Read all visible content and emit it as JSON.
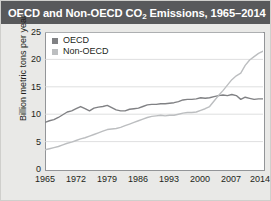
{
  "figure": {
    "title_main": "OECD and Non-OECD CO",
    "title_sub": "2",
    "title_rest": " Emissions, 1965–2014",
    "title_full": "OECD and Non-OECD CO2 Emissions, 1965–2014",
    "title_bar_color": "#58595b",
    "background_color": "#e9e9e7",
    "plot_background": "#ffffff",
    "frame_color": "#939598"
  },
  "legend": {
    "position": "top-left-inside",
    "entries": [
      {
        "label": "OECD",
        "color": "#808184"
      },
      {
        "label": "Non-OECD",
        "color": "#bcbec0"
      }
    ]
  },
  "axes": {
    "ylabel": "Billion metric tons per year",
    "yticks": [
      "0",
      "5",
      "10",
      "15",
      "20",
      "25"
    ],
    "xticks": [
      "1965",
      "1972",
      "1979",
      "1986",
      "1993",
      "2000",
      "2007",
      "2014"
    ]
  },
  "chart_data": {
    "type": "line",
    "title": "OECD and Non-OECD CO2 Emissions, 1965–2014",
    "xlabel": "",
    "ylabel": "Billion metric tons per year",
    "xlim": [
      1965,
      2014
    ],
    "ylim": [
      0,
      25
    ],
    "ytick_values": [
      0,
      5,
      10,
      15,
      20,
      25
    ],
    "xtick_values": [
      1965,
      1972,
      1979,
      1986,
      1993,
      2000,
      2007,
      2014
    ],
    "grid": "horizontal",
    "legend_position": "upper left",
    "x": [
      1965,
      1966,
      1967,
      1968,
      1969,
      1970,
      1971,
      1972,
      1973,
      1974,
      1975,
      1976,
      1977,
      1978,
      1979,
      1980,
      1981,
      1982,
      1983,
      1984,
      1985,
      1986,
      1987,
      1988,
      1989,
      1990,
      1991,
      1992,
      1993,
      1994,
      1995,
      1996,
      1997,
      1998,
      1999,
      2000,
      2001,
      2002,
      2003,
      2004,
      2005,
      2006,
      2007,
      2008,
      2009,
      2010,
      2011,
      2012,
      2013,
      2014
    ],
    "series": [
      {
        "name": "OECD",
        "color": "#808184",
        "values": [
          8.5,
          8.8,
          9.0,
          9.4,
          9.9,
          10.4,
          10.6,
          11.0,
          11.4,
          11.0,
          10.6,
          11.1,
          11.3,
          11.4,
          11.6,
          11.2,
          10.8,
          10.6,
          10.6,
          10.9,
          11.0,
          11.1,
          11.4,
          11.7,
          11.8,
          11.8,
          11.9,
          11.9,
          12.0,
          12.1,
          12.3,
          12.6,
          12.7,
          12.7,
          12.8,
          13.0,
          12.9,
          13.0,
          13.2,
          13.4,
          13.5,
          13.4,
          13.6,
          13.4,
          12.7,
          13.1,
          12.9,
          12.7,
          12.8,
          12.8
        ]
      },
      {
        "name": "Non-OECD",
        "color": "#bcbec0",
        "values": [
          3.5,
          3.7,
          3.9,
          4.1,
          4.4,
          4.7,
          4.9,
          5.2,
          5.5,
          5.7,
          6.0,
          6.3,
          6.6,
          6.9,
          7.2,
          7.3,
          7.4,
          7.6,
          7.9,
          8.2,
          8.5,
          8.8,
          9.1,
          9.4,
          9.6,
          9.7,
          9.8,
          9.7,
          9.8,
          9.8,
          10.0,
          10.2,
          10.3,
          10.3,
          10.4,
          10.7,
          11.0,
          11.4,
          12.4,
          13.4,
          14.3,
          15.3,
          16.3,
          17.0,
          17.5,
          18.9,
          19.9,
          20.5,
          21.1,
          21.5
        ]
      }
    ]
  }
}
